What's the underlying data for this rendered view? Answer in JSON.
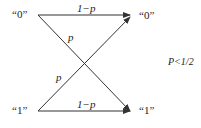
{
  "diagram": {
    "type": "binary-symmetric-channel",
    "inputs": [
      {
        "label": "“0”"
      },
      {
        "label": "“1”"
      }
    ],
    "outputs": [
      {
        "label": "“0”"
      },
      {
        "label": "“1”"
      }
    ],
    "edges": [
      {
        "from": "0",
        "to": "0",
        "label": "1−p"
      },
      {
        "from": "0",
        "to": "1",
        "label": "p"
      },
      {
        "from": "1",
        "to": "0",
        "label": "p"
      },
      {
        "from": "1",
        "to": "1",
        "label": "1−p"
      }
    ],
    "condition": "P<1/2",
    "line_color": "#333333"
  }
}
